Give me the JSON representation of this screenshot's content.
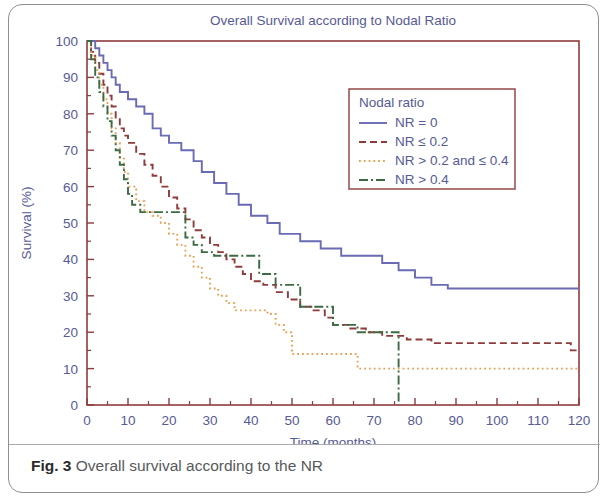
{
  "figure": {
    "caption_label": "Fig. 3",
    "caption_text": "Overall survival according to the NR"
  },
  "chart_data": {
    "type": "line",
    "subtype": "kaplan-meier-step",
    "title": "Overall Survival according to Nodal Ratio",
    "xlabel": "Time (months)",
    "ylabel": "Survival (%)",
    "xlim": [
      0,
      120
    ],
    "ylim": [
      0,
      100
    ],
    "xticks": [
      0,
      10,
      20,
      30,
      40,
      50,
      60,
      70,
      80,
      90,
      100,
      110,
      120
    ],
    "yticks": [
      0,
      10,
      20,
      30,
      40,
      50,
      60,
      70,
      80,
      90,
      100
    ],
    "xtick_labels": [
      "0",
      "10",
      "20",
      "30",
      "40",
      "50",
      "60",
      "70",
      "80",
      "90",
      "100",
      "110",
      "120"
    ],
    "ytick_labels": [
      "0",
      "10",
      "20",
      "30",
      "40",
      "50",
      "60",
      "70",
      "80",
      "90",
      "100"
    ],
    "grid": false,
    "minor_ticks": true,
    "legend_position": "upper-right-inside",
    "legend_title": "Nodal ratio",
    "series": [
      {
        "name": "NR = 0",
        "color": "#6a6ab5",
        "dash": "solid",
        "points": [
          [
            0,
            100
          ],
          [
            2,
            98
          ],
          [
            3,
            96
          ],
          [
            4,
            94
          ],
          [
            5,
            92
          ],
          [
            6,
            90
          ],
          [
            7,
            88
          ],
          [
            8,
            86
          ],
          [
            10,
            84
          ],
          [
            12,
            82
          ],
          [
            14,
            80
          ],
          [
            16,
            76
          ],
          [
            18,
            74
          ],
          [
            20,
            72
          ],
          [
            23,
            70
          ],
          [
            26,
            67
          ],
          [
            28,
            64
          ],
          [
            31,
            61
          ],
          [
            34,
            58
          ],
          [
            37,
            55
          ],
          [
            40,
            52
          ],
          [
            44,
            50
          ],
          [
            47,
            47
          ],
          [
            52,
            45
          ],
          [
            57,
            43
          ],
          [
            62,
            41
          ],
          [
            68,
            41
          ],
          [
            72,
            39
          ],
          [
            76,
            37
          ],
          [
            80,
            35
          ],
          [
            84,
            33
          ],
          [
            88,
            32
          ],
          [
            120,
            32
          ]
        ]
      },
      {
        "name": "NR ≤ 0.2",
        "color": "#8e3b3b",
        "dash": "dashed",
        "points": [
          [
            0,
            100
          ],
          [
            1,
            97
          ],
          [
            2,
            94
          ],
          [
            3,
            91
          ],
          [
            4,
            88
          ],
          [
            5,
            85
          ],
          [
            6,
            82
          ],
          [
            7,
            79
          ],
          [
            8,
            76
          ],
          [
            9,
            74
          ],
          [
            10,
            72
          ],
          [
            12,
            69
          ],
          [
            14,
            66
          ],
          [
            16,
            63
          ],
          [
            18,
            60
          ],
          [
            20,
            57
          ],
          [
            22,
            54
          ],
          [
            24,
            51
          ],
          [
            26,
            48
          ],
          [
            28,
            46
          ],
          [
            30,
            44
          ],
          [
            32,
            42
          ],
          [
            34,
            40
          ],
          [
            36,
            38
          ],
          [
            38,
            36
          ],
          [
            40,
            34
          ],
          [
            43,
            33
          ],
          [
            46,
            31
          ],
          [
            49,
            29
          ],
          [
            52,
            27
          ],
          [
            55,
            26
          ],
          [
            58,
            24
          ],
          [
            60,
            22
          ],
          [
            64,
            21
          ],
          [
            68,
            20
          ],
          [
            72,
            19
          ],
          [
            78,
            18
          ],
          [
            84,
            17
          ],
          [
            114,
            17
          ],
          [
            118,
            15
          ],
          [
            120,
            15
          ]
        ]
      },
      {
        "name": "NR > 0.2 and ≤ 0.4",
        "color": "#e8a157",
        "dash": "dotted",
        "points": [
          [
            0,
            100
          ],
          [
            1,
            96
          ],
          [
            2,
            92
          ],
          [
            3,
            88
          ],
          [
            4,
            84
          ],
          [
            5,
            80
          ],
          [
            6,
            76
          ],
          [
            7,
            72
          ],
          [
            8,
            68
          ],
          [
            9,
            64
          ],
          [
            10,
            60
          ],
          [
            12,
            56
          ],
          [
            14,
            53
          ],
          [
            16,
            52
          ],
          [
            18,
            50
          ],
          [
            20,
            47
          ],
          [
            22,
            44
          ],
          [
            24,
            41
          ],
          [
            26,
            38
          ],
          [
            28,
            35
          ],
          [
            30,
            32
          ],
          [
            32,
            30
          ],
          [
            34,
            28
          ],
          [
            36,
            26
          ],
          [
            40,
            26
          ],
          [
            44,
            25
          ],
          [
            46,
            22
          ],
          [
            48,
            20
          ],
          [
            50,
            14
          ],
          [
            62,
            14
          ],
          [
            66,
            10
          ],
          [
            120,
            10
          ]
        ]
      },
      {
        "name": "NR > 0.4",
        "color": "#3c6b43",
        "dash": "dashdot",
        "points": [
          [
            0,
            100
          ],
          [
            1,
            95
          ],
          [
            2,
            90
          ],
          [
            3,
            86
          ],
          [
            4,
            82
          ],
          [
            5,
            78
          ],
          [
            6,
            74
          ],
          [
            7,
            70
          ],
          [
            8,
            66
          ],
          [
            9,
            62
          ],
          [
            10,
            58
          ],
          [
            11,
            55
          ],
          [
            13,
            53
          ],
          [
            16,
            53
          ],
          [
            20,
            53
          ],
          [
            23,
            53
          ],
          [
            24,
            46
          ],
          [
            26,
            44
          ],
          [
            28,
            42
          ],
          [
            31,
            41
          ],
          [
            34,
            41
          ],
          [
            38,
            41
          ],
          [
            42,
            36
          ],
          [
            46,
            33
          ],
          [
            49,
            33
          ],
          [
            52,
            27
          ],
          [
            56,
            27
          ],
          [
            58,
            27
          ],
          [
            60,
            22
          ],
          [
            64,
            22
          ],
          [
            66,
            20
          ],
          [
            70,
            20
          ],
          [
            74,
            20
          ],
          [
            76,
            20
          ],
          [
            76,
            0
          ]
        ]
      }
    ]
  }
}
